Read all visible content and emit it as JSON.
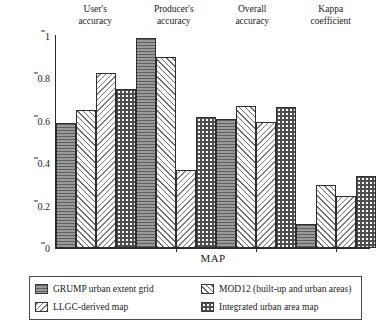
{
  "chart_data": {
    "type": "bar",
    "title": "",
    "xlabel": "MAP",
    "ylabel": "Accuracy",
    "ylim": [
      0,
      1
    ],
    "yticks": [
      "0",
      "0.2",
      "0.4",
      "0.6",
      "0.8",
      "1"
    ],
    "ytick_values": [
      0,
      0.2,
      0.4,
      0.6,
      0.8,
      1
    ],
    "grid": false,
    "legend_position": "below-axes",
    "categories": [
      "User's accuracy",
      "Producer's accuracy",
      "Overall accuracy",
      "Kappa coefficient"
    ],
    "category_lines": [
      [
        "User's",
        "accuracy"
      ],
      [
        "Producer's",
        "accuracy"
      ],
      [
        "Overall",
        "accuracy"
      ],
      [
        "Kappa",
        "coefficient"
      ]
    ],
    "series": [
      {
        "name": "GRUMP urban extent grid",
        "pattern": "horizontal-lines-dark-gray",
        "values": [
          0.59,
          0.99,
          0.61,
          0.115
        ]
      },
      {
        "name": "MOD12 (built-up and urban areas)",
        "pattern": "diagonal-hatch-forward",
        "values": [
          0.65,
          0.9,
          0.67,
          0.295
        ]
      },
      {
        "name": "LLGC-derived map",
        "pattern": "diagonal-hatch-backward",
        "values": [
          0.825,
          0.37,
          0.595,
          0.245
        ]
      },
      {
        "name": "Integrated urban area map",
        "pattern": "checkerboard",
        "values": [
          0.75,
          0.62,
          0.665,
          0.34
        ]
      }
    ]
  },
  "legend": {
    "items": [
      {
        "label": "GRUMP urban extent grid",
        "swatch": "pat-grump"
      },
      {
        "label": "MOD12 (built-up and urban areas)",
        "swatch": "pat-mod12"
      },
      {
        "label": "LLGC-derived map",
        "swatch": "pat-llgc"
      },
      {
        "label": "Integrated urban area map",
        "swatch": "pat-integrated"
      }
    ]
  },
  "colors": {
    "grump_fill": "#8a8a8a",
    "grump_line": "#5e5e5e",
    "hatch": "#6b6b6b",
    "checker": "#4f4f4f",
    "axis": "#2a2a2a",
    "text": "#1a1a1a",
    "background": "#ffffff"
  }
}
